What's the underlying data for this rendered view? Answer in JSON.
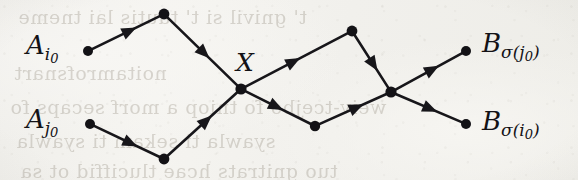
{
  "figure": {
    "name": "crossing-lattice-paths",
    "background_color": "#f2f1ee",
    "ink_color": "#17161a"
  },
  "labels": {
    "source_upper": {
      "base": "A",
      "sub_letter": "i",
      "sub_digit": "0"
    },
    "source_lower": {
      "base": "A",
      "sub_letter": "j",
      "sub_digit": "0"
    },
    "crossing": {
      "base": "X"
    },
    "target_upper": {
      "base": "B",
      "sub_letter": "σ",
      "paren_open": "(",
      "paren_letter": "j",
      "paren_digit": "0",
      "paren_close": ")"
    },
    "target_lower": {
      "base": "B",
      "sub_letter": "σ",
      "paren_open": "(",
      "paren_letter": "i",
      "paren_digit": "0",
      "paren_close": ")"
    }
  },
  "bleed_through_lines": [
    {
      "text": "t' gnivil si t' tautis lai tneme",
      "x": 18,
      "y": 6
    },
    {
      "text": "noitamrofsnart",
      "x": 14,
      "y": 62
    },
    {
      "text": "weiv-tcejbo fo tniop a morf secaps fo",
      "x": 10,
      "y": 96
    },
    {
      "text": "syawla ti sekam ti syawla",
      "x": 16,
      "y": 130
    },
    {
      "text": "tuo gnitrats hcae tluciffid ot sa",
      "x": 20,
      "y": 160
    }
  ],
  "vertices": [
    {
      "name": "source-upper-dot",
      "x": 88,
      "y": 51,
      "r": 5.0
    },
    {
      "name": "peak-upper-left",
      "x": 164,
      "y": 14,
      "r": 5.4
    },
    {
      "name": "crossing-x",
      "x": 241,
      "y": 89,
      "r": 5.6
    },
    {
      "name": "peak-upper-right",
      "x": 352,
      "y": 31,
      "r": 5.4
    },
    {
      "name": "crossing-right",
      "x": 391,
      "y": 92,
      "r": 5.6
    },
    {
      "name": "target-upper-dot",
      "x": 466,
      "y": 51,
      "r": 5.0
    },
    {
      "name": "source-lower-dot",
      "x": 90,
      "y": 124,
      "r": 5.0
    },
    {
      "name": "valley-lower-left",
      "x": 164,
      "y": 159,
      "r": 5.4
    },
    {
      "name": "valley-lower-mid",
      "x": 315,
      "y": 126,
      "r": 5.2
    },
    {
      "name": "target-lower-dot",
      "x": 466,
      "y": 124,
      "r": 5.0
    }
  ],
  "edges": [
    {
      "name": "edge-source-upper-to-peak",
      "from": "source-upper-dot",
      "to": "peak-upper-left",
      "arrow_t": 0.55
    },
    {
      "name": "edge-peak-to-crossing-x",
      "from": "peak-upper-left",
      "to": "crossing-x",
      "arrow_t": 0.52
    },
    {
      "name": "edge-crossing-x-to-peak-right",
      "from": "crossing-x",
      "to": "peak-upper-right",
      "arrow_t": 0.47
    },
    {
      "name": "edge-peak-right-to-crossing-r",
      "from": "peak-upper-right",
      "to": "crossing-right",
      "arrow_t": 0.55
    },
    {
      "name": "edge-crossing-r-to-target-up",
      "from": "crossing-right",
      "to": "target-upper-dot",
      "arrow_t": 0.55
    },
    {
      "name": "edge-source-lower-to-valley",
      "from": "source-lower-dot",
      "to": "valley-lower-left",
      "arrow_t": 0.55
    },
    {
      "name": "edge-valley-to-crossing-x",
      "from": "valley-lower-left",
      "to": "crossing-x",
      "arrow_t": 0.55
    },
    {
      "name": "edge-crossing-x-to-valley-mid",
      "from": "crossing-x",
      "to": "valley-lower-mid",
      "arrow_t": 0.47
    },
    {
      "name": "edge-valley-mid-to-crossing-r",
      "from": "valley-lower-mid",
      "to": "crossing-right",
      "arrow_t": 0.55
    },
    {
      "name": "edge-crossing-r-to-target-low",
      "from": "crossing-right",
      "to": "target-lower-dot",
      "arrow_t": 0.52
    }
  ],
  "label_positions": {
    "source_upper": {
      "x": 26,
      "y": 32
    },
    "source_lower": {
      "x": 26,
      "y": 106
    },
    "crossing": {
      "x": 236,
      "y": 50
    },
    "target_upper": {
      "x": 482,
      "y": 30
    },
    "target_lower": {
      "x": 482,
      "y": 108
    }
  }
}
